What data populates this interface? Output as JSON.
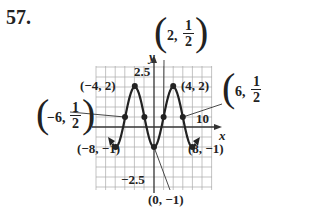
{
  "problem_number": "57.",
  "chart_data": {
    "type": "line",
    "title": "",
    "function": "y = 1/2 - (3/2)cos(pi x / 4)",
    "xlabel": "x",
    "ylabel": "y",
    "xlim": [
      -12,
      12
    ],
    "ylim": [
      -3,
      3
    ],
    "grid": true,
    "tick_labels": {
      "x": [
        "10"
      ],
      "y": [
        "2.5",
        "-2.5"
      ]
    },
    "points": [
      {
        "x": -8,
        "y": -1,
        "label": "(−8, −1)"
      },
      {
        "x": -6,
        "y": 0.5,
        "label": "(−6, 1/2)"
      },
      {
        "x": -4,
        "y": 2,
        "label": "(−4, 2)"
      },
      {
        "x": -2,
        "y": 0.5,
        "label": ""
      },
      {
        "x": 0,
        "y": -1,
        "label": "(0, −1)"
      },
      {
        "x": 2,
        "y": 0.5,
        "label": "(2, 1/2)"
      },
      {
        "x": 4,
        "y": 2,
        "label": "(4, 2)"
      },
      {
        "x": 6,
        "y": 0.5,
        "label": "(6, 1/2)"
      },
      {
        "x": 8,
        "y": -1,
        "label": "(8, −1)"
      }
    ]
  },
  "labels": {
    "p_m4_2": "(−4, 2)",
    "p_4_2": "(4, 2)",
    "p_m8_m1": "(−8, −1)",
    "p_8_m1": "(8, −1)",
    "p_0_m1": "(0, −1)",
    "p_2_half_pre": "2,",
    "p_6_half_pre": "6,",
    "p_m6_half_pre": "−6,",
    "half_num": "1",
    "half_den": "2",
    "tick_25": "2.5",
    "tick_m25": "−2.5",
    "tick_10": "10",
    "axis_x": "x",
    "axis_y": "y"
  }
}
